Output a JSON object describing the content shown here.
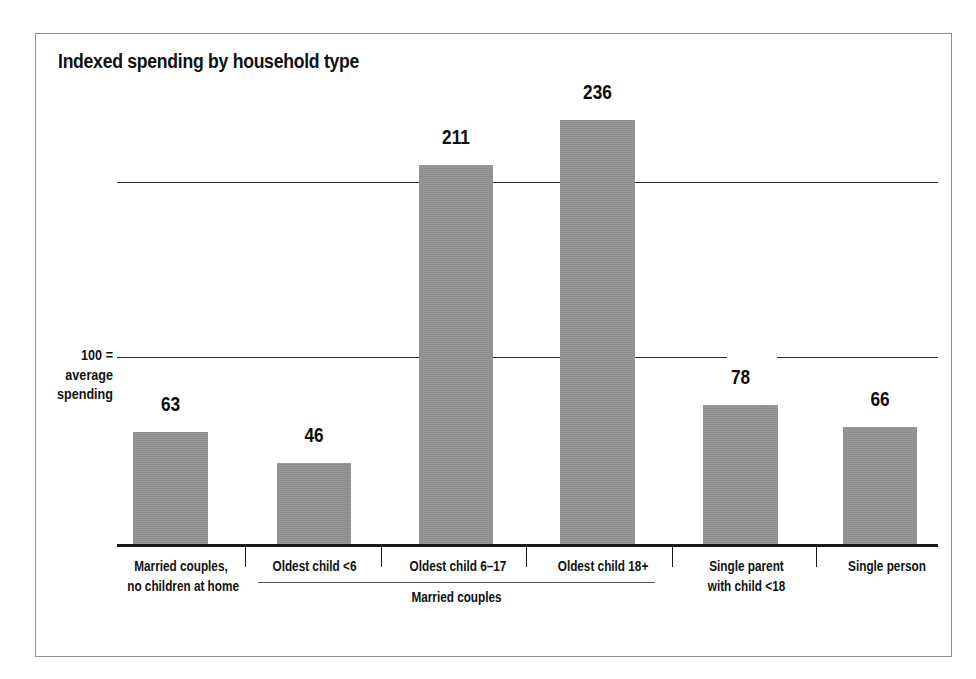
{
  "chart_data": {
    "type": "bar",
    "title": "Indexed spending by household type",
    "xlabel": "",
    "ylabel": "",
    "ylim": [
      0,
      260
    ],
    "grid": true,
    "gridlines": [
      100,
      200
    ],
    "legend_position": "none",
    "categories": [
      "Married couples,\nno children at home",
      "Oldest child <6",
      "Oldest child 6–17",
      "Oldest child 18+",
      "Single parent\nwith child <18",
      "Single person"
    ],
    "category_lines": [
      [
        "Married couples,",
        "no children at home"
      ],
      [
        "Oldest child <6"
      ],
      [
        "Oldest child 6–17"
      ],
      [
        "Oldest child 18+"
      ],
      [
        "Single parent",
        "with child <18"
      ],
      [
        "Single person"
      ]
    ],
    "values": [
      63,
      46,
      211,
      236,
      78,
      66
    ],
    "value_labels": [
      "63",
      "46",
      "211",
      "236",
      "78",
      "66"
    ],
    "annotations": [
      {
        "name": "reference-line-note",
        "lines": [
          "100 =",
          "average",
          "spending"
        ],
        "at_value": 100
      },
      {
        "name": "group-bracket",
        "label": "Married couples",
        "covers": [
          1,
          2,
          3
        ]
      }
    ],
    "bar_color": "#949494",
    "axis_color": "#1a1a1a",
    "grid_color": "#2b2b2b",
    "frame_color": "#8e8e8e",
    "text_color": "#111111"
  },
  "geometry": {
    "baseline_y": 546,
    "px_per_unit": 1.807,
    "bars": [
      {
        "left": 133,
        "width": 75,
        "top": 432
      },
      {
        "left": 277,
        "width": 74,
        "top": 463
      },
      {
        "left": 419,
        "width": 74,
        "top": 165
      },
      {
        "left": 560,
        "width": 75,
        "top": 120
      },
      {
        "left": 703,
        "width": 75,
        "top": 405
      },
      {
        "left": 843,
        "width": 74,
        "top": 427
      }
    ],
    "value_label_tops": [
      392,
      423,
      125,
      80,
      365,
      387
    ],
    "category_label_left_tops": [
      {
        "left": 117,
        "width": 128,
        "top": 556
      },
      {
        "left": 247,
        "width": 135,
        "top": 556
      },
      {
        "left": 388,
        "width": 140,
        "top": 556
      },
      {
        "left": 533,
        "width": 140,
        "top": 556
      },
      {
        "left": 678,
        "width": 137,
        "top": 556
      },
      {
        "left": 822,
        "width": 130,
        "top": 556
      }
    ],
    "gridline_tops": [
      182,
      357
    ],
    "gridline_segments": [
      [
        {
          "left": 0,
          "width": 821
        }
      ],
      [
        {
          "left": 0,
          "width": 610
        },
        {
          "left": 660,
          "width": 161
        }
      ]
    ],
    "tick_xs": [
      245,
      381,
      526,
      672,
      816
    ]
  }
}
